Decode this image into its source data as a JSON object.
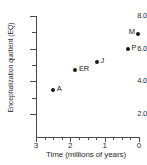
{
  "chart_data": {
    "type": "scatter",
    "title": "",
    "xlabel": "Time (millions of years)",
    "ylabel": "Encephalization quotient (EQ)",
    "xlim": [
      3,
      0
    ],
    "ylim": [
      2.0,
      8.0
    ],
    "x_reversed": true,
    "grid": false,
    "legend": "none",
    "x_ticks": [
      "3",
      "2",
      "1",
      "0"
    ],
    "x_tick_values": [
      3,
      2,
      1,
      0
    ],
    "x_minor_tick_values": [
      2.75,
      2.5,
      2.25,
      1.75,
      1.5,
      1.25,
      0.75,
      0.5,
      0.25
    ],
    "y_ticks": [
      "8.0",
      "6.0",
      "4.0",
      "2.0"
    ],
    "y_tick_values": [
      8.0,
      6.0,
      4.0,
      2.0
    ],
    "y_minor_tick_values": [
      7.0,
      5.0,
      3.0
    ],
    "points": [
      {
        "label": "A",
        "x": 2.5,
        "y": 3.45,
        "label_side": "right"
      },
      {
        "label": "ER",
        "x": 1.85,
        "y": 4.7,
        "label_side": "right"
      },
      {
        "label": "J",
        "x": 1.22,
        "y": 5.18,
        "label_side": "right"
      },
      {
        "label": "P",
        "x": 0.32,
        "y": 6.0,
        "label_side": "right"
      },
      {
        "label": "M",
        "x": 0.03,
        "y": 6.92,
        "label_side": "left"
      }
    ]
  },
  "colors": {
    "axis": "#4a4a4a",
    "text": "#2b2b2b",
    "marker": "#1a1a1a",
    "background": "#ffffff"
  }
}
